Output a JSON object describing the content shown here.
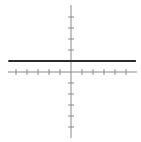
{
  "chart_data": {
    "type": "line",
    "title": "",
    "xlabel": "",
    "ylabel": "",
    "xlim": [
      -5.5,
      6
    ],
    "ylim": [
      -6,
      6
    ],
    "grid": false,
    "legend": null,
    "axes": {
      "x_ticks": [
        -5,
        -4,
        -3,
        -2,
        -1,
        1,
        2,
        3,
        4,
        5
      ],
      "y_ticks_above": [
        1,
        2,
        3,
        4,
        5
      ],
      "y_ticks_below": [
        -1,
        -2,
        -3,
        -4,
        -5
      ],
      "tick_labels_shown": false
    },
    "series": [
      {
        "name": "horizontal line y = 1",
        "equation": "y = 1",
        "x": [
          -5.7,
          5.9
        ],
        "values": [
          1,
          1
        ],
        "color": "#2a2a2a",
        "line_width": 2
      }
    ]
  },
  "layout": {
    "origin_px": [
      71,
      72
    ],
    "unit_px": 11,
    "x_axis_px": [
      8,
      137
    ],
    "y_axis_px": [
      5,
      138
    ],
    "axis_color": "#8a8a8a",
    "line_color": "#2a2a2a"
  },
  "caption": "Graph of the horizontal line y = 1 on a coordinate plane"
}
